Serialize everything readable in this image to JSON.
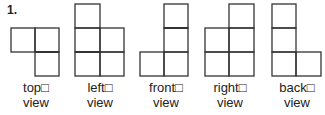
{
  "problem_number": "1.",
  "views": [
    {
      "name": "top",
      "label_line1": "top□",
      "label_line2": "view"
    },
    {
      "name": "left",
      "label_line1": "left□",
      "label_line2": "view"
    },
    {
      "name": "front",
      "label_line1": "front□",
      "label_line2": "view"
    },
    {
      "name": "right",
      "label_line1": "right□",
      "label_line2": "view"
    },
    {
      "name": "back",
      "label_line1": "back□",
      "label_line2": "view"
    }
  ]
}
